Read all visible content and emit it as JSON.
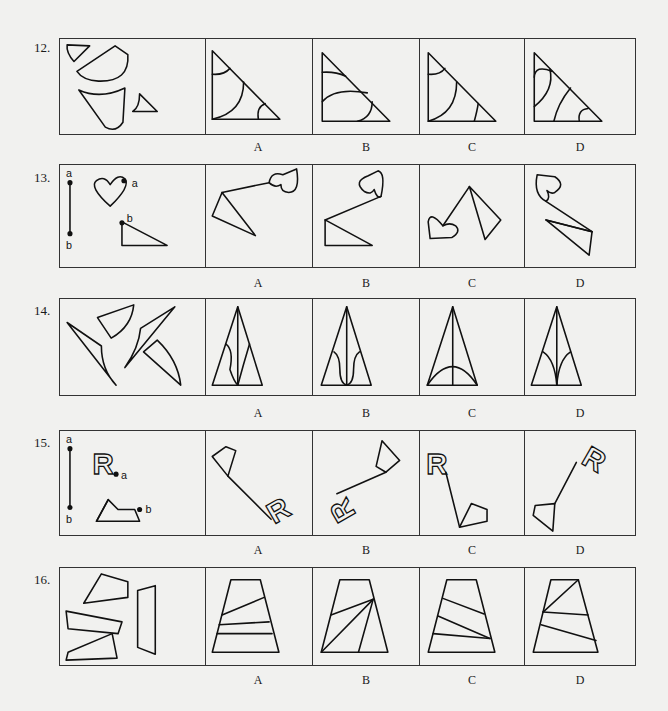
{
  "questions": [
    {
      "number": "12.",
      "options": [
        "A",
        "B",
        "C",
        "D"
      ]
    },
    {
      "number": "13.",
      "options": [
        "A",
        "B",
        "C",
        "D"
      ],
      "point_labels": {
        "a": "a",
        "b": "b"
      }
    },
    {
      "number": "14.",
      "options": [
        "A",
        "B",
        "C",
        "D"
      ]
    },
    {
      "number": "15.",
      "options": [
        "A",
        "B",
        "C",
        "D"
      ],
      "point_labels": {
        "a": "a",
        "b": "b"
      },
      "letter_shape": "R"
    },
    {
      "number": "16.",
      "options": [
        "A",
        "B",
        "C",
        "D"
      ]
    }
  ]
}
